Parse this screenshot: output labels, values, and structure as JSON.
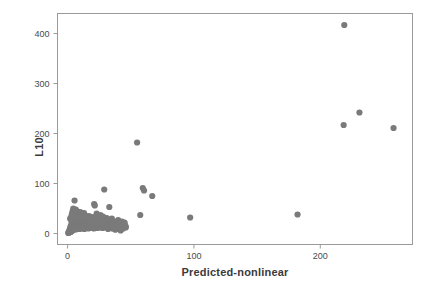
{
  "chart_data": {
    "type": "scatter",
    "title": "",
    "xlabel": "Predicted-nonlinear",
    "ylabel": "L10",
    "xlim": [
      -8,
      273
    ],
    "ylim": [
      -22,
      440
    ],
    "xticks": [
      0,
      100,
      200
    ],
    "yticks": [
      0,
      100,
      200,
      300,
      400
    ],
    "xtick_labels": [
      "0",
      "100",
      "200"
    ],
    "ytick_labels": [
      "0",
      "100",
      "200",
      "300",
      "400"
    ],
    "grid": false,
    "legend": null,
    "marker": {
      "shape": "circle",
      "color": "#7a7a7a",
      "size": 3.1
    },
    "axis_color": "#9a9a9a",
    "points": [
      [
        0.5,
        1
      ],
      [
        0.8,
        2
      ],
      [
        1.0,
        3
      ],
      [
        1.2,
        5
      ],
      [
        1.4,
        2
      ],
      [
        1.6,
        7
      ],
      [
        1.8,
        4
      ],
      [
        2.0,
        9
      ],
      [
        2.1,
        12
      ],
      [
        2.3,
        6
      ],
      [
        2.5,
        15
      ],
      [
        2.6,
        3
      ],
      [
        2.8,
        10
      ],
      [
        3.0,
        18
      ],
      [
        3.1,
        8
      ],
      [
        3.3,
        22
      ],
      [
        3.5,
        5
      ],
      [
        3.6,
        13
      ],
      [
        3.8,
        26
      ],
      [
        4.0,
        9
      ],
      [
        4.1,
        17
      ],
      [
        4.3,
        30
      ],
      [
        4.5,
        7
      ],
      [
        4.6,
        21
      ],
      [
        4.8,
        12
      ],
      [
        5.0,
        34
      ],
      [
        5.1,
        16
      ],
      [
        5.3,
        25
      ],
      [
        5.5,
        10
      ],
      [
        5.6,
        38
      ],
      [
        5.8,
        19
      ],
      [
        6.0,
        14
      ],
      [
        6.1,
        29
      ],
      [
        6.3,
        23
      ],
      [
        6.5,
        8
      ],
      [
        6.6,
        41
      ],
      [
        6.8,
        17
      ],
      [
        7.0,
        31
      ],
      [
        7.2,
        12
      ],
      [
        7.4,
        26
      ],
      [
        7.5,
        20
      ],
      [
        7.7,
        36
      ],
      [
        7.9,
        15
      ],
      [
        8.0,
        24
      ],
      [
        8.2,
        11
      ],
      [
        8.4,
        28
      ],
      [
        8.6,
        18
      ],
      [
        8.8,
        33
      ],
      [
        9.0,
        14
      ],
      [
        9.2,
        22
      ],
      [
        9.4,
        9
      ],
      [
        9.6,
        27
      ],
      [
        9.8,
        16
      ],
      [
        10.0,
        20
      ],
      [
        10.2,
        31
      ],
      [
        10.5,
        13
      ],
      [
        10.8,
        24
      ],
      [
        11.0,
        18
      ],
      [
        11.2,
        10
      ],
      [
        11.5,
        26
      ],
      [
        11.8,
        15
      ],
      [
        12.0,
        21
      ],
      [
        12.3,
        12
      ],
      [
        12.5,
        28
      ],
      [
        12.8,
        17
      ],
      [
        13.0,
        23
      ],
      [
        13.3,
        9
      ],
      [
        13.6,
        19
      ],
      [
        13.9,
        14
      ],
      [
        14.2,
        25
      ],
      [
        14.5,
        11
      ],
      [
        14.8,
        20
      ],
      [
        15.0,
        16
      ],
      [
        15.3,
        22
      ],
      [
        15.6,
        13
      ],
      [
        15.9,
        18
      ],
      [
        16.2,
        24
      ],
      [
        16.5,
        10
      ],
      [
        16.8,
        15
      ],
      [
        17.0,
        21
      ],
      [
        17.4,
        12
      ],
      [
        17.7,
        17
      ],
      [
        18.0,
        23
      ],
      [
        18.3,
        14
      ],
      [
        18.6,
        19
      ],
      [
        19.0,
        11
      ],
      [
        19.3,
        16
      ],
      [
        19.6,
        22
      ],
      [
        19.9,
        13
      ],
      [
        20.2,
        18
      ],
      [
        20.5,
        25
      ],
      [
        20.8,
        10
      ],
      [
        21.1,
        15
      ],
      [
        21.5,
        20
      ],
      [
        21.8,
        12
      ],
      [
        22.1,
        17
      ],
      [
        22.4,
        23
      ],
      [
        22.8,
        14
      ],
      [
        23.1,
        19
      ],
      [
        23.5,
        11
      ],
      [
        23.8,
        16
      ],
      [
        24.2,
        21
      ],
      [
        24.5,
        13
      ],
      [
        24.9,
        18
      ],
      [
        25.2,
        24
      ],
      [
        25.6,
        12
      ],
      [
        26.0,
        17
      ],
      [
        26.4,
        22
      ],
      [
        26.8,
        14
      ],
      [
        27.2,
        19
      ],
      [
        27.6,
        11
      ],
      [
        28.0,
        16
      ],
      [
        28.4,
        21
      ],
      [
        28.8,
        13
      ],
      [
        29.2,
        18
      ],
      [
        29.6,
        23
      ],
      [
        30.0,
        12
      ],
      [
        30.5,
        17
      ],
      [
        31.0,
        20
      ],
      [
        31.5,
        14
      ],
      [
        32.0,
        9
      ],
      [
        32.5,
        18
      ],
      [
        33.0,
        12
      ],
      [
        33.5,
        16
      ],
      [
        34.0,
        21
      ],
      [
        34.5,
        13
      ],
      [
        35.0,
        17
      ],
      [
        35.5,
        10
      ],
      [
        36.0,
        15
      ],
      [
        36.5,
        19
      ],
      [
        37.0,
        12
      ],
      [
        37.5,
        8
      ],
      [
        38.0,
        16
      ],
      [
        38.5,
        20
      ],
      [
        39.0,
        11
      ],
      [
        39.5,
        14
      ],
      [
        40.0,
        18
      ],
      [
        40.5,
        9
      ],
      [
        41.0,
        13
      ],
      [
        41.5,
        17
      ],
      [
        42.0,
        21
      ],
      [
        42.5,
        12
      ],
      [
        43.0,
        15
      ],
      [
        43.5,
        19
      ],
      [
        44.0,
        10
      ],
      [
        44.5,
        14
      ],
      [
        45.0,
        22
      ],
      [
        45.5,
        16
      ],
      [
        46.0,
        12
      ],
      [
        2.0,
        30
      ],
      [
        2.5,
        28
      ],
      [
        3.0,
        35
      ],
      [
        3.5,
        40
      ],
      [
        4.0,
        45
      ],
      [
        4.5,
        50
      ],
      [
        5.0,
        42
      ],
      [
        5.5,
        66
      ],
      [
        6.0,
        38
      ],
      [
        6.5,
        48
      ],
      [
        7.0,
        33
      ],
      [
        8.0,
        44
      ],
      [
        9.0,
        37
      ],
      [
        10.0,
        43
      ],
      [
        11.0,
        39
      ],
      [
        12.0,
        34
      ],
      [
        13.0,
        41
      ],
      [
        14.0,
        36
      ],
      [
        15.0,
        32
      ],
      [
        16.0,
        29
      ],
      [
        17.0,
        35
      ],
      [
        18.0,
        31
      ],
      [
        19.0,
        27
      ],
      [
        20.0,
        33
      ],
      [
        21.0,
        59
      ],
      [
        21.5,
        56
      ],
      [
        22.0,
        30
      ],
      [
        23.0,
        40
      ],
      [
        24.0,
        26
      ],
      [
        25.0,
        32
      ],
      [
        26.0,
        37
      ],
      [
        27.0,
        29
      ],
      [
        28.0,
        34
      ],
      [
        29.0,
        88
      ],
      [
        30.0,
        25
      ],
      [
        31.0,
        31
      ],
      [
        32.0,
        28
      ],
      [
        33.0,
        53
      ],
      [
        34.0,
        23
      ],
      [
        35.0,
        30
      ],
      [
        36.0,
        17
      ],
      [
        37.0,
        24
      ],
      [
        38.0,
        8
      ],
      [
        39.0,
        20
      ],
      [
        40.0,
        27
      ],
      [
        41.0,
        12
      ],
      [
        42.0,
        6
      ],
      [
        43.0,
        24
      ],
      [
        44.0,
        18
      ],
      [
        45.0,
        21
      ],
      [
        46.0,
        14
      ],
      [
        55.0,
        182
      ],
      [
        57.5,
        37
      ],
      [
        59.5,
        91
      ],
      [
        60.5,
        86
      ],
      [
        67.0,
        75
      ],
      [
        97.0,
        32
      ],
      [
        182.0,
        38
      ],
      [
        218.5,
        217
      ],
      [
        219.0,
        417
      ],
      [
        231.0,
        242
      ],
      [
        258.0,
        211
      ]
    ]
  }
}
